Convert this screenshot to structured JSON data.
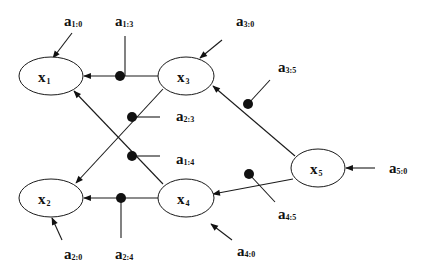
{
  "diagram": {
    "type": "directed-network",
    "nodes": [
      {
        "id": "x1",
        "base": "x",
        "sub": "1"
      },
      {
        "id": "x2",
        "base": "x",
        "sub": "2"
      },
      {
        "id": "x3",
        "base": "x",
        "sub": "3"
      },
      {
        "id": "x4",
        "base": "x",
        "sub": "4"
      },
      {
        "id": "x5",
        "base": "x",
        "sub": "5"
      }
    ],
    "params": [
      {
        "id": "a1:0",
        "base": "a",
        "sub": "1:0"
      },
      {
        "id": "a1:3",
        "base": "a",
        "sub": "1:3"
      },
      {
        "id": "a3:0",
        "base": "a",
        "sub": "3:0"
      },
      {
        "id": "a3:5",
        "base": "a",
        "sub": "3:5"
      },
      {
        "id": "a2:3",
        "base": "a",
        "sub": "2:3"
      },
      {
        "id": "a1:4",
        "base": "a",
        "sub": "1:4"
      },
      {
        "id": "a5:0",
        "base": "a",
        "sub": "5:0"
      },
      {
        "id": "a4:5",
        "base": "a",
        "sub": "4:5"
      },
      {
        "id": "a2:0",
        "base": "a",
        "sub": "2:0"
      },
      {
        "id": "a2:4",
        "base": "a",
        "sub": "2:4"
      },
      {
        "id": "a4:0",
        "base": "a",
        "sub": "4:0"
      }
    ],
    "edges": [
      {
        "from": "x3",
        "to": "x1",
        "gain": "a1:3"
      },
      {
        "from": "x4",
        "to": "x1",
        "gain": "a1:4"
      },
      {
        "from": "x3",
        "to": "x2",
        "gain": "a2:3"
      },
      {
        "from": "x4",
        "to": "x2",
        "gain": "a2:4"
      },
      {
        "from": "x5",
        "to": "x3",
        "gain": "a3:5"
      },
      {
        "from": "x5",
        "to": "x4",
        "gain": "a4:5"
      }
    ],
    "inputs": [
      {
        "to": "x1",
        "gain": "a1:0"
      },
      {
        "to": "x2",
        "gain": "a2:0"
      },
      {
        "to": "x3",
        "gain": "a3:0"
      },
      {
        "to": "x4",
        "gain": "a4:0"
      },
      {
        "to": "x5",
        "gain": "a5:0"
      }
    ]
  }
}
